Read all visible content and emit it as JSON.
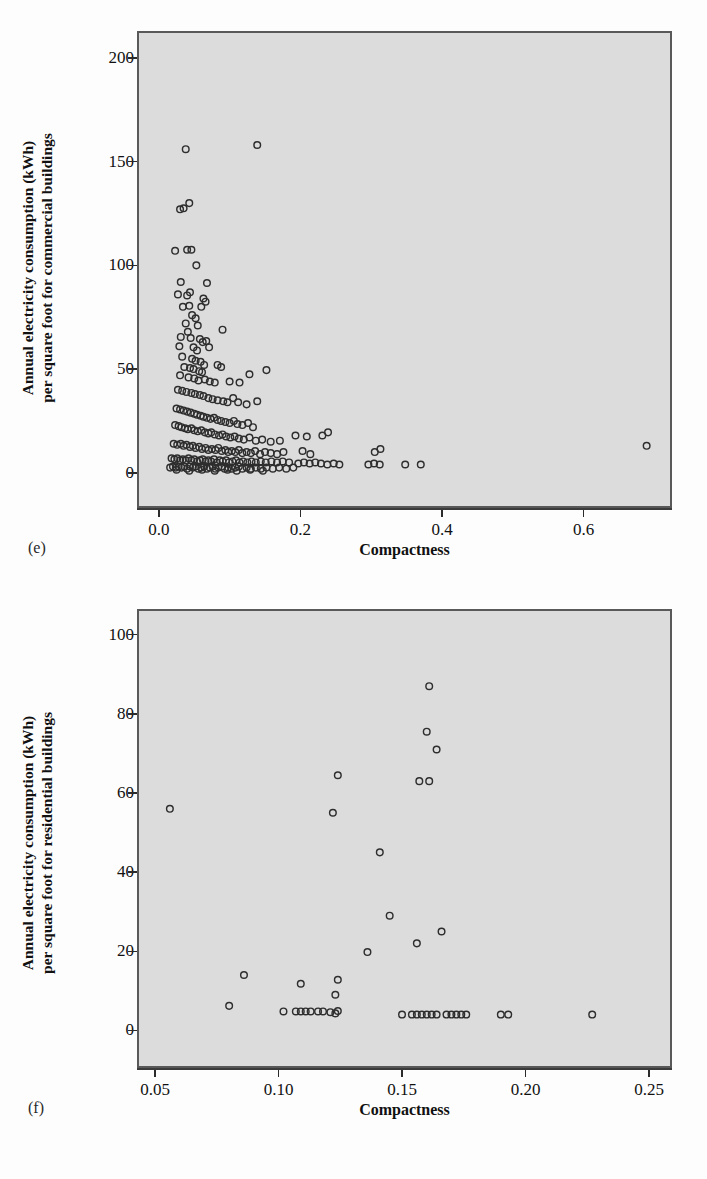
{
  "figure": {
    "panels": [
      {
        "tag": "(e)",
        "xlabel": "Compactness",
        "ylabel_line1": "Annual electricity consumption (kWh)",
        "ylabel_line2": "per square foot for commercial buildings"
      },
      {
        "tag": "(f)",
        "xlabel": "Compactness",
        "ylabel_line1": "Annual electricity consumption (kWh)",
        "ylabel_line2": "per square foot for residential buildings"
      }
    ]
  },
  "style": {
    "plot_background": "#dcdcdc",
    "frame_color": "#595959",
    "marker_color": "#2e2e2e",
    "page_background": "#fdfdfd"
  },
  "chart_data": [
    {
      "type": "scatter",
      "panel": "(e)",
      "title": "",
      "xlabel": "Compactness",
      "ylabel": "Annual electricity consumption (kWh) per square foot for commercial buildings",
      "xlim": [
        -0.028,
        0.722
      ],
      "ylim": [
        -16,
        212
      ],
      "xticks": [
        0.0,
        0.2,
        0.4,
        0.6
      ],
      "xticklabels": [
        "0.0",
        "0.2",
        "0.4",
        "0.6"
      ],
      "yticks": [
        0,
        50,
        100,
        150,
        200
      ],
      "yticklabels": [
        "0",
        "50",
        "100",
        "150",
        "200"
      ],
      "grid": false,
      "legend": false,
      "marker": "open-circle",
      "points": [
        [
          0.038,
          156.0
        ],
        [
          0.139,
          158.0
        ],
        [
          0.03,
          127.0
        ],
        [
          0.035,
          127.5
        ],
        [
          0.043,
          130.0
        ],
        [
          0.023,
          107.0
        ],
        [
          0.04,
          107.5
        ],
        [
          0.046,
          107.5
        ],
        [
          0.053,
          100.0
        ],
        [
          0.031,
          92.0
        ],
        [
          0.068,
          91.5
        ],
        [
          0.027,
          86.0
        ],
        [
          0.04,
          85.5
        ],
        [
          0.044,
          87.0
        ],
        [
          0.063,
          84.0
        ],
        [
          0.066,
          82.5
        ],
        [
          0.034,
          80.0
        ],
        [
          0.043,
          80.5
        ],
        [
          0.06,
          80.0
        ],
        [
          0.047,
          76.0
        ],
        [
          0.052,
          74.5
        ],
        [
          0.038,
          72.0
        ],
        [
          0.055,
          71.0
        ],
        [
          0.041,
          68.0
        ],
        [
          0.09,
          69.0
        ],
        [
          0.031,
          65.5
        ],
        [
          0.045,
          65.0
        ],
        [
          0.058,
          64.5
        ],
        [
          0.062,
          63.0
        ],
        [
          0.067,
          63.5
        ],
        [
          0.029,
          61.0
        ],
        [
          0.049,
          60.5
        ],
        [
          0.054,
          59.0
        ],
        [
          0.071,
          60.5
        ],
        [
          0.033,
          56.0
        ],
        [
          0.047,
          55.0
        ],
        [
          0.052,
          54.0
        ],
        [
          0.059,
          53.5
        ],
        [
          0.064,
          52.0
        ],
        [
          0.036,
          51.0
        ],
        [
          0.044,
          50.5
        ],
        [
          0.049,
          50.0
        ],
        [
          0.057,
          49.0
        ],
        [
          0.061,
          48.5
        ],
        [
          0.083,
          52.0
        ],
        [
          0.088,
          51.0
        ],
        [
          0.03,
          47.0
        ],
        [
          0.042,
          46.0
        ],
        [
          0.05,
          45.5
        ],
        [
          0.056,
          44.5
        ],
        [
          0.065,
          45.0
        ],
        [
          0.072,
          44.0
        ],
        [
          0.079,
          43.5
        ],
        [
          0.1,
          44.0
        ],
        [
          0.114,
          43.5
        ],
        [
          0.128,
          47.5
        ],
        [
          0.152,
          49.5
        ],
        [
          0.027,
          40.0
        ],
        [
          0.033,
          39.5
        ],
        [
          0.039,
          39.0
        ],
        [
          0.046,
          38.5
        ],
        [
          0.051,
          38.0
        ],
        [
          0.058,
          37.5
        ],
        [
          0.063,
          37.0
        ],
        [
          0.07,
          36.0
        ],
        [
          0.076,
          35.5
        ],
        [
          0.083,
          35.0
        ],
        [
          0.091,
          34.5
        ],
        [
          0.097,
          34.0
        ],
        [
          0.105,
          36.0
        ],
        [
          0.112,
          34.0
        ],
        [
          0.124,
          33.0
        ],
        [
          0.139,
          34.5
        ],
        [
          0.025,
          31.0
        ],
        [
          0.03,
          30.5
        ],
        [
          0.035,
          30.0
        ],
        [
          0.04,
          29.5
        ],
        [
          0.045,
          29.0
        ],
        [
          0.05,
          28.5
        ],
        [
          0.054,
          28.0
        ],
        [
          0.059,
          27.5
        ],
        [
          0.063,
          27.0
        ],
        [
          0.068,
          26.5
        ],
        [
          0.073,
          26.0
        ],
        [
          0.078,
          26.5
        ],
        [
          0.083,
          25.5
        ],
        [
          0.088,
          25.0
        ],
        [
          0.094,
          24.5
        ],
        [
          0.1,
          24.0
        ],
        [
          0.106,
          25.0
        ],
        [
          0.111,
          23.5
        ],
        [
          0.118,
          23.0
        ],
        [
          0.126,
          24.0
        ],
        [
          0.133,
          22.0
        ],
        [
          0.023,
          23.0
        ],
        [
          0.028,
          22.5
        ],
        [
          0.032,
          22.0
        ],
        [
          0.037,
          21.5
        ],
        [
          0.041,
          21.0
        ],
        [
          0.046,
          21.5
        ],
        [
          0.05,
          20.5
        ],
        [
          0.055,
          20.0
        ],
        [
          0.06,
          20.5
        ],
        [
          0.065,
          19.5
        ],
        [
          0.07,
          19.0
        ],
        [
          0.074,
          19.5
        ],
        [
          0.079,
          18.5
        ],
        [
          0.085,
          18.0
        ],
        [
          0.09,
          18.5
        ],
        [
          0.095,
          17.5
        ],
        [
          0.101,
          17.0
        ],
        [
          0.107,
          17.5
        ],
        [
          0.113,
          16.5
        ],
        [
          0.12,
          16.0
        ],
        [
          0.128,
          17.0
        ],
        [
          0.137,
          15.5
        ],
        [
          0.146,
          16.0
        ],
        [
          0.158,
          15.0
        ],
        [
          0.171,
          15.5
        ],
        [
          0.193,
          18.0
        ],
        [
          0.209,
          17.5
        ],
        [
          0.231,
          18.0
        ],
        [
          0.239,
          19.5
        ],
        [
          0.021,
          14.0
        ],
        [
          0.026,
          13.5
        ],
        [
          0.031,
          14.0
        ],
        [
          0.035,
          13.0
        ],
        [
          0.039,
          13.5
        ],
        [
          0.044,
          12.5
        ],
        [
          0.048,
          13.0
        ],
        [
          0.052,
          12.0
        ],
        [
          0.057,
          12.5
        ],
        [
          0.061,
          11.5
        ],
        [
          0.066,
          12.0
        ],
        [
          0.07,
          11.0
        ],
        [
          0.075,
          11.5
        ],
        [
          0.08,
          11.0
        ],
        [
          0.084,
          12.0
        ],
        [
          0.089,
          10.5
        ],
        [
          0.094,
          11.0
        ],
        [
          0.098,
          10.0
        ],
        [
          0.103,
          10.5
        ],
        [
          0.108,
          10.0
        ],
        [
          0.113,
          11.0
        ],
        [
          0.118,
          9.5
        ],
        [
          0.124,
          10.0
        ],
        [
          0.13,
          9.5
        ],
        [
          0.136,
          10.5
        ],
        [
          0.143,
          9.0
        ],
        [
          0.15,
          10.0
        ],
        [
          0.158,
          9.5
        ],
        [
          0.167,
          9.0
        ],
        [
          0.176,
          10.0
        ],
        [
          0.203,
          10.5
        ],
        [
          0.214,
          9.0
        ],
        [
          0.305,
          10.0
        ],
        [
          0.313,
          11.5
        ],
        [
          0.689,
          13.0
        ],
        [
          0.018,
          7.0
        ],
        [
          0.022,
          6.5
        ],
        [
          0.026,
          7.0
        ],
        [
          0.03,
          6.0
        ],
        [
          0.034,
          6.5
        ],
        [
          0.038,
          6.0
        ],
        [
          0.042,
          7.0
        ],
        [
          0.046,
          6.0
        ],
        [
          0.05,
          6.5
        ],
        [
          0.054,
          5.5
        ],
        [
          0.058,
          6.0
        ],
        [
          0.062,
          6.5
        ],
        [
          0.066,
          5.5
        ],
        [
          0.07,
          6.0
        ],
        [
          0.074,
          5.5
        ],
        [
          0.078,
          6.5
        ],
        [
          0.082,
          5.0
        ],
        [
          0.086,
          6.0
        ],
        [
          0.09,
          5.5
        ],
        [
          0.095,
          6.0
        ],
        [
          0.099,
          5.0
        ],
        [
          0.104,
          5.5
        ],
        [
          0.109,
          6.0
        ],
        [
          0.114,
          5.0
        ],
        [
          0.119,
          5.5
        ],
        [
          0.125,
          5.0
        ],
        [
          0.131,
          5.5
        ],
        [
          0.137,
          5.0
        ],
        [
          0.144,
          5.5
        ],
        [
          0.151,
          5.0
        ],
        [
          0.159,
          5.5
        ],
        [
          0.167,
          5.0
        ],
        [
          0.175,
          5.5
        ],
        [
          0.184,
          5.0
        ],
        [
          0.197,
          4.5
        ],
        [
          0.205,
          5.0
        ],
        [
          0.213,
          4.5
        ],
        [
          0.221,
          5.0
        ],
        [
          0.229,
          4.5
        ],
        [
          0.238,
          4.0
        ],
        [
          0.247,
          4.5
        ],
        [
          0.255,
          4.0
        ],
        [
          0.296,
          4.0
        ],
        [
          0.304,
          4.5
        ],
        [
          0.312,
          4.0
        ],
        [
          0.348,
          4.0
        ],
        [
          0.37,
          4.0
        ],
        [
          0.016,
          2.5
        ],
        [
          0.02,
          3.0
        ],
        [
          0.024,
          2.5
        ],
        [
          0.028,
          3.0
        ],
        [
          0.032,
          2.5
        ],
        [
          0.036,
          3.0
        ],
        [
          0.04,
          2.0
        ],
        [
          0.044,
          3.0
        ],
        [
          0.048,
          2.5
        ],
        [
          0.052,
          3.0
        ],
        [
          0.056,
          2.0
        ],
        [
          0.06,
          2.5
        ],
        [
          0.064,
          3.0
        ],
        [
          0.068,
          2.0
        ],
        [
          0.072,
          2.5
        ],
        [
          0.076,
          3.0
        ],
        [
          0.08,
          2.0
        ],
        [
          0.084,
          2.5
        ],
        [
          0.089,
          3.0
        ],
        [
          0.093,
          2.0
        ],
        [
          0.098,
          2.5
        ],
        [
          0.103,
          2.0
        ],
        [
          0.108,
          2.5
        ],
        [
          0.113,
          3.0
        ],
        [
          0.118,
          2.0
        ],
        [
          0.124,
          2.5
        ],
        [
          0.13,
          2.0
        ],
        [
          0.137,
          2.5
        ],
        [
          0.144,
          2.0
        ],
        [
          0.152,
          2.5
        ],
        [
          0.161,
          2.0
        ],
        [
          0.17,
          2.5
        ],
        [
          0.18,
          2.0
        ],
        [
          0.19,
          2.5
        ],
        [
          0.025,
          1.5
        ],
        [
          0.043,
          1.0
        ],
        [
          0.061,
          1.5
        ],
        [
          0.079,
          1.0
        ],
        [
          0.097,
          1.5
        ],
        [
          0.11,
          1.0
        ],
        [
          0.129,
          1.5
        ],
        [
          0.147,
          1.0
        ]
      ]
    },
    {
      "type": "scatter",
      "panel": "(f)",
      "title": "",
      "xlabel": "Compactness",
      "ylabel": "Annual electricity consumption (kWh) per square foot for residential buildings",
      "xlim": [
        0.0435,
        0.2585
      ],
      "ylim": [
        -9,
        106
      ],
      "xticks": [
        0.05,
        0.1,
        0.15,
        0.2,
        0.25
      ],
      "xticklabels": [
        "0.05",
        "0.10",
        "0.15",
        "0.20",
        "0.25"
      ],
      "yticks": [
        0,
        20,
        40,
        60,
        80,
        100
      ],
      "yticklabels": [
        "0",
        "20",
        "40",
        "60",
        "80",
        "100"
      ],
      "grid": false,
      "legend": false,
      "marker": "open-circle",
      "points": [
        [
          0.161,
          87.0
        ],
        [
          0.16,
          75.5
        ],
        [
          0.164,
          71.0
        ],
        [
          0.124,
          64.5
        ],
        [
          0.157,
          63.0
        ],
        [
          0.161,
          63.0
        ],
        [
          0.056,
          56.0
        ],
        [
          0.122,
          55.0
        ],
        [
          0.141,
          45.0
        ],
        [
          0.145,
          29.0
        ],
        [
          0.166,
          25.0
        ],
        [
          0.156,
          22.0
        ],
        [
          0.136,
          19.8
        ],
        [
          0.086,
          14.0
        ],
        [
          0.124,
          12.8
        ],
        [
          0.109,
          11.8
        ],
        [
          0.123,
          9.0
        ],
        [
          0.08,
          6.2
        ],
        [
          0.102,
          4.8
        ],
        [
          0.107,
          4.8
        ],
        [
          0.109,
          4.8
        ],
        [
          0.111,
          4.8
        ],
        [
          0.113,
          4.8
        ],
        [
          0.116,
          4.8
        ],
        [
          0.118,
          4.8
        ],
        [
          0.121,
          4.6
        ],
        [
          0.123,
          4.3
        ],
        [
          0.124,
          4.9
        ],
        [
          0.15,
          4.0
        ],
        [
          0.154,
          4.0
        ],
        [
          0.156,
          4.0
        ],
        [
          0.158,
          4.0
        ],
        [
          0.16,
          4.0
        ],
        [
          0.162,
          4.0
        ],
        [
          0.164,
          4.0
        ],
        [
          0.168,
          4.0
        ],
        [
          0.17,
          4.0
        ],
        [
          0.172,
          4.0
        ],
        [
          0.174,
          4.0
        ],
        [
          0.176,
          4.0
        ],
        [
          0.19,
          4.0
        ],
        [
          0.193,
          4.0
        ],
        [
          0.227,
          4.0
        ]
      ]
    }
  ]
}
